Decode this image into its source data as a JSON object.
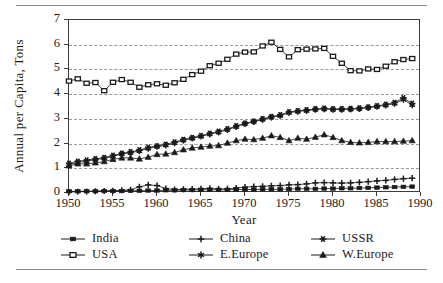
{
  "chart_data": {
    "type": "line",
    "title": "",
    "xlabel": "Year",
    "ylabel": "Annual per Capita, Tons",
    "xlim": [
      1950,
      1990
    ],
    "ylim": [
      0,
      7
    ],
    "xticks": [
      1950,
      1955,
      1960,
      1965,
      1970,
      1975,
      1980,
      1985,
      1990
    ],
    "yticks": [
      0,
      1,
      2,
      3,
      4,
      5,
      6,
      7
    ],
    "grid": "horizontal-dashed",
    "legend_position": "bottom",
    "x": [
      1950,
      1951,
      1952,
      1953,
      1954,
      1955,
      1956,
      1957,
      1958,
      1959,
      1960,
      1961,
      1962,
      1963,
      1964,
      1965,
      1966,
      1967,
      1968,
      1969,
      1970,
      1971,
      1972,
      1973,
      1974,
      1975,
      1976,
      1977,
      1978,
      1979,
      1980,
      1981,
      1982,
      1983,
      1984,
      1985,
      1986,
      1987,
      1988,
      1989
    ],
    "series": [
      {
        "name": "India",
        "marker": "filled-square",
        "values": [
          0.07,
          0.07,
          0.07,
          0.07,
          0.08,
          0.08,
          0.08,
          0.09,
          0.09,
          0.1,
          0.1,
          0.11,
          0.11,
          0.12,
          0.12,
          0.13,
          0.13,
          0.13,
          0.13,
          0.14,
          0.14,
          0.14,
          0.15,
          0.15,
          0.15,
          0.16,
          0.17,
          0.17,
          0.17,
          0.18,
          0.18,
          0.19,
          0.19,
          0.2,
          0.21,
          0.22,
          0.23,
          0.24,
          0.25,
          0.26
        ]
      },
      {
        "name": "USA",
        "marker": "open-square",
        "values": [
          4.53,
          4.62,
          4.44,
          4.47,
          4.14,
          4.48,
          4.59,
          4.48,
          4.28,
          4.38,
          4.42,
          4.36,
          4.46,
          4.6,
          4.79,
          4.93,
          5.15,
          5.25,
          5.41,
          5.62,
          5.7,
          5.71,
          5.95,
          6.1,
          5.81,
          5.51,
          5.8,
          5.82,
          5.83,
          5.85,
          5.53,
          5.25,
          4.95,
          4.94,
          5.02,
          5.0,
          5.13,
          5.31,
          5.4,
          5.44
        ]
      },
      {
        "name": "China",
        "marker": "plus",
        "values": [
          0.04,
          0.05,
          0.06,
          0.07,
          0.08,
          0.09,
          0.11,
          0.13,
          0.25,
          0.33,
          0.3,
          0.18,
          0.14,
          0.15,
          0.16,
          0.17,
          0.19,
          0.16,
          0.17,
          0.2,
          0.24,
          0.26,
          0.27,
          0.29,
          0.3,
          0.33,
          0.34,
          0.37,
          0.41,
          0.42,
          0.41,
          0.4,
          0.41,
          0.43,
          0.46,
          0.49,
          0.51,
          0.55,
          0.58,
          0.6
        ]
      },
      {
        "name": "E.Europe",
        "marker": "star-x",
        "values": [
          1.14,
          1.24,
          1.28,
          1.35,
          1.4,
          1.48,
          1.58,
          1.63,
          1.7,
          1.8,
          1.88,
          1.93,
          2.02,
          2.13,
          2.21,
          2.29,
          2.38,
          2.46,
          2.56,
          2.68,
          2.8,
          2.88,
          2.97,
          3.06,
          3.13,
          3.25,
          3.3,
          3.33,
          3.38,
          3.4,
          3.38,
          3.38,
          3.39,
          3.41,
          3.45,
          3.5,
          3.55,
          3.62,
          3.78,
          3.56
        ]
      },
      {
        "name": "USSR",
        "marker": "asterisk",
        "values": [
          1.2,
          1.28,
          1.33,
          1.38,
          1.43,
          1.52,
          1.6,
          1.66,
          1.74,
          1.84,
          1.9,
          1.97,
          2.06,
          2.16,
          2.24,
          2.32,
          2.41,
          2.49,
          2.59,
          2.71,
          2.82,
          2.9,
          3.0,
          3.09,
          3.16,
          3.28,
          3.32,
          3.36,
          3.4,
          3.42,
          3.4,
          3.4,
          3.41,
          3.43,
          3.47,
          3.52,
          3.58,
          3.66,
          3.85,
          3.62
        ]
      },
      {
        "name": "W.Europe",
        "marker": "triangle",
        "values": [
          1.1,
          1.18,
          1.18,
          1.22,
          1.27,
          1.36,
          1.42,
          1.42,
          1.38,
          1.45,
          1.56,
          1.58,
          1.64,
          1.75,
          1.82,
          1.86,
          1.9,
          1.92,
          2.02,
          2.12,
          2.18,
          2.16,
          2.22,
          2.32,
          2.25,
          2.12,
          2.22,
          2.18,
          2.26,
          2.36,
          2.25,
          2.12,
          2.05,
          2.03,
          2.05,
          2.08,
          2.08,
          2.08,
          2.1,
          2.12
        ]
      }
    ],
    "legend": [
      {
        "label": "India",
        "marker": "filled-square"
      },
      {
        "label": "China",
        "marker": "plus"
      },
      {
        "label": "USSR",
        "marker": "asterisk"
      },
      {
        "label": "USA",
        "marker": "open-square"
      },
      {
        "label": "E.Europe",
        "marker": "star-x"
      },
      {
        "label": "W.Europe",
        "marker": "triangle"
      }
    ],
    "colors": {
      "series": "#1a1a1a",
      "grid": "#9a9a9a",
      "axis": "#3c3c3c",
      "rule": "#8a8a8a",
      "background": "#ffffff"
    }
  }
}
